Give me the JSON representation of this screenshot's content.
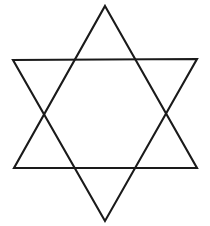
{
  "figure": {
    "name": "hexagram",
    "background_color": "#ffffff",
    "stroke_color": "#1a1a1a",
    "stroke_width": 2.1,
    "fill": "none",
    "canvas": {
      "width": 210,
      "height": 226
    },
    "shapes": [
      {
        "name": "upward-triangle",
        "points": "105,6 197,168 14,168",
        "vertices": [
          {
            "label": "top-apex",
            "x": 105,
            "y": 6
          },
          {
            "label": "bottom-right-point",
            "x": 197,
            "y": 168
          },
          {
            "label": "bottom-left-point",
            "x": 14,
            "y": 168
          }
        ]
      },
      {
        "name": "downward-triangle",
        "points": "105,221 13,60 197,59",
        "vertices": [
          {
            "label": "bottom-apex",
            "x": 105,
            "y": 221
          },
          {
            "label": "top-left-point",
            "x": 13,
            "y": 60
          },
          {
            "label": "top-right-point",
            "x": 197,
            "y": 59
          }
        ]
      }
    ],
    "inner_hexagon": {
      "name": "inner-hexagon-intersections",
      "points": [
        {
          "label": "upper-left-crossing",
          "x": 78,
          "y": 77
        },
        {
          "label": "upper-right-crossing",
          "x": 131,
          "y": 77
        },
        {
          "label": "right-crossing",
          "x": 154,
          "y": 116
        },
        {
          "label": "lower-right-crossing",
          "x": 131,
          "y": 155
        },
        {
          "label": "lower-left-crossing",
          "x": 78,
          "y": 155
        },
        {
          "label": "left-crossing",
          "x": 55,
          "y": 116
        }
      ]
    }
  }
}
